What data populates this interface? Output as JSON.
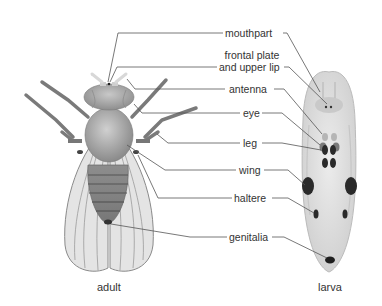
{
  "diagram": {
    "subjects": [
      {
        "id": "adult",
        "caption": "adult"
      },
      {
        "id": "larva",
        "caption": "larva"
      }
    ],
    "labels": [
      {
        "id": "mouthpart",
        "text": "mouthpart"
      },
      {
        "id": "frontal-plate",
        "line1": "frontal plate",
        "line2": "and upper lip"
      },
      {
        "id": "antenna",
        "text": "antenna"
      },
      {
        "id": "eye",
        "text": "eye"
      },
      {
        "id": "leg",
        "text": "leg"
      },
      {
        "id": "wing",
        "text": "wing"
      },
      {
        "id": "haltere",
        "text": "haltere"
      },
      {
        "id": "genitalia",
        "text": "genitalia"
      }
    ],
    "colors": {
      "leader_line": "#555555",
      "adult_body": "#9a9a9a",
      "wing_fill": "#e4e4e4",
      "larva_body": "#dedede",
      "imaginal_disc": "#2a2a2a"
    }
  }
}
